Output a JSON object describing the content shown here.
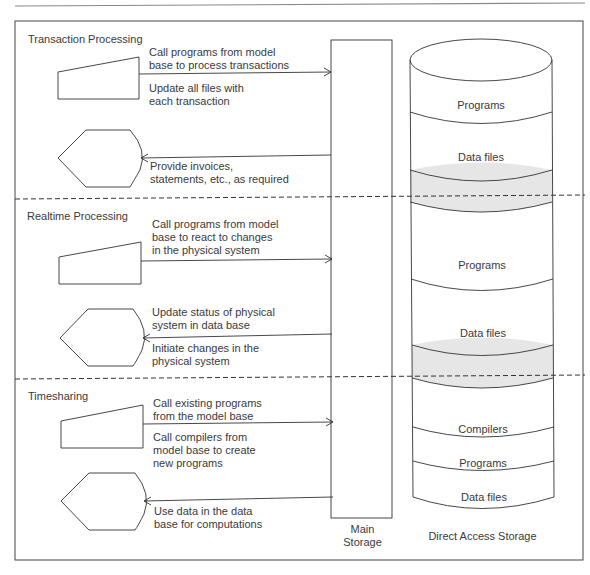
{
  "sections": [
    {
      "title": "Transaction Processing",
      "input_notes": [
        "Call programs from model",
        "base to process transactions"
      ],
      "input_notes_below": [
        "Update all files with",
        "each transaction"
      ],
      "output_notes": [
        "Provide invoices,",
        "statements, etc., as required"
      ]
    },
    {
      "title": "Realtime Processing",
      "input_notes": [
        "Call programs from model",
        "base to react to changes",
        "in the physical system"
      ],
      "output_notes_above": [
        "Update status of physical",
        "system in data base"
      ],
      "output_notes": [
        "Initiate changes in the",
        "physical system"
      ]
    },
    {
      "title": "Timesharing",
      "input_notes": [
        "Call existing programs",
        "from the model base"
      ],
      "input_notes_below": [
        "Call compilers from",
        "model base to create",
        "new programs"
      ],
      "output_notes": [
        "Use data in the data",
        "base for computations"
      ]
    }
  ],
  "main_storage": {
    "label_line1": "Main",
    "label_line2": "Storage"
  },
  "direct_access_storage": {
    "label": "Direct Access Storage",
    "layers": [
      "Programs",
      "Data files",
      "Programs",
      "Data files",
      "Compilers",
      "Programs",
      "Data files"
    ]
  },
  "colors": {
    "line": "#333333",
    "gray_band": "#e6e6e6"
  }
}
